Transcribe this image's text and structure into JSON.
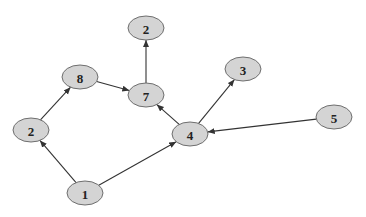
{
  "diagram": {
    "type": "directed-graph",
    "style": {
      "node_fill": "#d4d4d4",
      "node_stroke": "#6e6e6e",
      "edge_color": "#333333",
      "background": "#ffffff"
    },
    "nodes": [
      {
        "id": "n2top",
        "label": "2",
        "cx": 146,
        "cy": 28
      },
      {
        "id": "n8",
        "label": "8",
        "cx": 80,
        "cy": 77
      },
      {
        "id": "n7",
        "label": "7",
        "cx": 146,
        "cy": 95
      },
      {
        "id": "n3",
        "label": "3",
        "cx": 243,
        "cy": 69
      },
      {
        "id": "n2left",
        "label": "2",
        "cx": 31,
        "cy": 130
      },
      {
        "id": "n4",
        "label": "4",
        "cx": 190,
        "cy": 134
      },
      {
        "id": "n5",
        "label": "5",
        "cx": 334,
        "cy": 117
      },
      {
        "id": "n1",
        "label": "1",
        "cx": 85,
        "cy": 193
      }
    ],
    "edges": [
      {
        "from": "n1",
        "to": "n2left"
      },
      {
        "from": "n1",
        "to": "n4"
      },
      {
        "from": "n2left",
        "to": "n8"
      },
      {
        "from": "n8",
        "to": "n7"
      },
      {
        "from": "n7",
        "to": "n2top"
      },
      {
        "from": "n4",
        "to": "n7"
      },
      {
        "from": "n4",
        "to": "n3"
      },
      {
        "from": "n5",
        "to": "n4"
      }
    ]
  }
}
